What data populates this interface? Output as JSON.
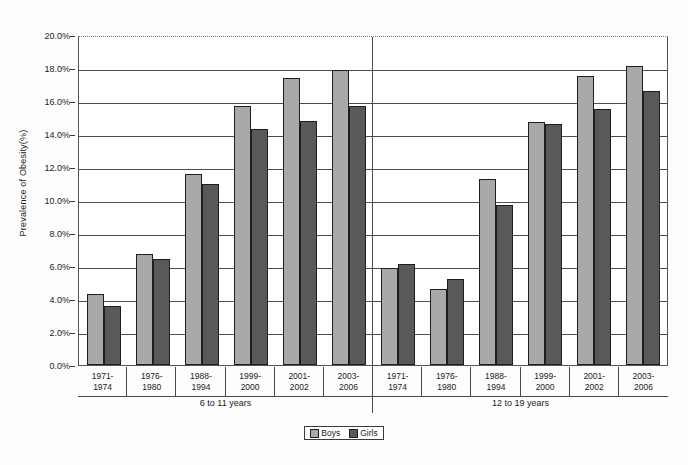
{
  "chart_data": {
    "type": "bar",
    "title": "",
    "subtitle": "",
    "xlabel": "",
    "ylabel": "Prevalence of Obesity(%)",
    "ylim": [
      0,
      20
    ],
    "ytick_labels": [
      "20.0%",
      "18.0%",
      "16.0%",
      "14.0%",
      "12.0%",
      "10.0%",
      "8.0%",
      "6.0%",
      "4.0%",
      "2.0%",
      "0.0%"
    ],
    "ytick_values": [
      20,
      18,
      16,
      14,
      12,
      10,
      8,
      6,
      4,
      2,
      0
    ],
    "grid": true,
    "legend_position": "bottom-center",
    "categories": [
      "1971-1974",
      "1976-1980",
      "1988-1994",
      "1999-2000",
      "2001-2002",
      "2003-2006",
      "1971-1974",
      "1976-1980",
      "1988-1994",
      "1999-2000",
      "2001-2002",
      "2003-2006"
    ],
    "group_labels": [
      "6 to 11 years",
      "12 to 19 years"
    ],
    "series": [
      {
        "name": "Boys",
        "color": "#a9a9a9",
        "values": [
          4.3,
          6.7,
          11.6,
          15.7,
          17.4,
          17.9,
          5.9,
          4.6,
          11.3,
          14.7,
          17.5,
          18.1
        ]
      },
      {
        "name": "Girls",
        "color": "#595959",
        "values": [
          3.6,
          6.4,
          11.0,
          14.3,
          14.8,
          15.7,
          6.1,
          5.2,
          9.7,
          14.6,
          15.5,
          16.6
        ]
      }
    ],
    "clusters": [
      {
        "label": "6 to 11 years",
        "points": [
          {
            "period_line1": "1971-",
            "period_line2": "1974",
            "boys": 4.3,
            "girls": 3.6
          },
          {
            "period_line1": "1976-",
            "period_line2": "1980",
            "boys": 6.7,
            "girls": 6.4
          },
          {
            "period_line1": "1988-",
            "period_line2": "1994",
            "boys": 11.6,
            "girls": 11.0
          },
          {
            "period_line1": "1999-",
            "period_line2": "2000",
            "boys": 15.7,
            "girls": 14.3
          },
          {
            "period_line1": "2001-",
            "period_line2": "2002",
            "boys": 17.4,
            "girls": 14.8
          },
          {
            "period_line1": "2003-",
            "period_line2": "2006",
            "boys": 17.9,
            "girls": 15.7
          }
        ]
      },
      {
        "label": "12 to 19 years",
        "points": [
          {
            "period_line1": "1971-",
            "period_line2": "1974",
            "boys": 5.9,
            "girls": 6.1
          },
          {
            "period_line1": "1976-",
            "period_line2": "1980",
            "boys": 4.6,
            "girls": 5.2
          },
          {
            "period_line1": "1988-",
            "period_line2": "1994",
            "boys": 11.3,
            "girls": 9.7
          },
          {
            "period_line1": "1999-",
            "period_line2": "2000",
            "boys": 14.7,
            "girls": 14.6
          },
          {
            "period_line1": "2001-",
            "period_line2": "2002",
            "boys": 17.5,
            "girls": 15.5
          },
          {
            "period_line1": "2003-",
            "period_line2": "2006",
            "boys": 18.1,
            "girls": 16.6
          }
        ]
      }
    ]
  },
  "legend": {
    "items": [
      {
        "label": "Boys",
        "color": "#a9a9a9"
      },
      {
        "label": "Girls",
        "color": "#595959"
      }
    ]
  }
}
